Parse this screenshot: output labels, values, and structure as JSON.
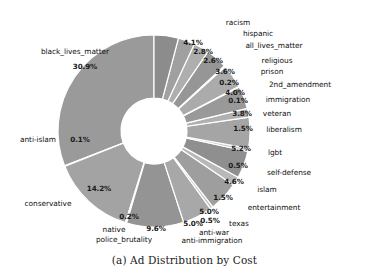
{
  "figure": {
    "caption": "(a) Ad Distribution by Cost",
    "background": "#ffffff"
  },
  "chart_data": {
    "type": "pie",
    "variant": "donut",
    "title": "(a) Ad Distribution by Cost",
    "xlabel": "",
    "ylabel": "",
    "legend": "none",
    "grid": false,
    "value_unit": "percent",
    "autopct_format": "%.1f%%",
    "start_angle_deg": 90,
    "direction": "counterclockwise",
    "center": {
      "x": 154,
      "y": 131
    },
    "outer_radius": 96,
    "inner_radius": 33,
    "categories": [
      "black_lives_matter",
      "anti-islam",
      "conservative",
      "native",
      "police_brutality",
      "anti-immigration",
      "anti-war",
      "texas",
      "entertainment",
      "islam",
      "self-defense",
      "lgbt",
      "liberalism",
      "veteran",
      "immigration",
      "2nd_amendment",
      "prison",
      "religious",
      "all_lives_matter",
      "hispanic",
      "racism"
    ],
    "values": [
      30.9,
      0.1,
      14.2,
      0.2,
      9.6,
      5.0,
      0.5,
      5.0,
      1.5,
      4.6,
      0.5,
      5.2,
      1.5,
      3.8,
      0.1,
      4.0,
      0.2,
      3.6,
      2.6,
      2.8,
      4.1
    ],
    "value_labels": [
      "30.9%",
      "0.1%",
      "14.2%",
      "0.2%",
      "9.6%",
      "5.0%",
      "0.5%",
      "5.0%",
      "1.5%",
      "4.6%",
      "0.5%",
      "5.2%",
      "1.5%",
      "3.8%",
      "0.1%",
      "4.0%",
      "0.2%",
      "3.6%",
      "2.6%",
      "2.8%",
      "4.1%"
    ],
    "slice_colors": [
      "#9a9a9a",
      "#b4b4b4",
      "#a3a3a3",
      "#bdbdbd",
      "#949494",
      "#a8a8a8",
      "#c2c2c2",
      "#9e9e9e",
      "#b8b8b8",
      "#8f8f8f",
      "#c6c6c6",
      "#a5a5a5",
      "#b0b0b0",
      "#999999",
      "#c0c0c0",
      "#ababab",
      "#bbbbbb",
      "#969696",
      "#aeaeae",
      "#a0a0a0",
      "#8c8c8c"
    ],
    "wedge_edge_color": "#ffffff",
    "wedge_edge_width": 1.2
  },
  "pct_labels": [
    {
      "text": "30.9%",
      "x": 85,
      "y": 66
    },
    {
      "text": "0.1%",
      "x": 80,
      "y": 139
    },
    {
      "text": "14.2%",
      "x": 99,
      "y": 188
    },
    {
      "text": "0.2%",
      "x": 129,
      "y": 216
    },
    {
      "text": "9.6%",
      "x": 156,
      "y": 228
    },
    {
      "text": "5.0%",
      "x": 193,
      "y": 223
    },
    {
      "text": "0.5%",
      "x": 210,
      "y": 220
    },
    {
      "text": "5.0%",
      "x": 209,
      "y": 211
    },
    {
      "text": "1.5%",
      "x": 223,
      "y": 197
    },
    {
      "text": "4.6%",
      "x": 234,
      "y": 181
    },
    {
      "text": "0.5%",
      "x": 238,
      "y": 165
    },
    {
      "text": "5.2%",
      "x": 241,
      "y": 148
    },
    {
      "text": "1.5%",
      "x": 243,
      "y": 128
    },
    {
      "text": "3.8%",
      "x": 242,
      "y": 113
    },
    {
      "text": "0.1%",
      "x": 238,
      "y": 100
    },
    {
      "text": "4.0%",
      "x": 235,
      "y": 92
    },
    {
      "text": "0.2%",
      "x": 229,
      "y": 82
    },
    {
      "text": "3.6%",
      "x": 225,
      "y": 71
    },
    {
      "text": "2.6%",
      "x": 213,
      "y": 60
    },
    {
      "text": "2.8%",
      "x": 203,
      "y": 51
    },
    {
      "text": "4.1%",
      "x": 193,
      "y": 42
    }
  ],
  "cat_labels": [
    {
      "text": "black_lives_matter",
      "x": 75,
      "y": 51
    },
    {
      "text": "anti-islam",
      "x": 38,
      "y": 139
    },
    {
      "text": "conservative",
      "x": 48,
      "y": 203
    },
    {
      "text": "native",
      "x": 114,
      "y": 229
    },
    {
      "text": "police_brutality",
      "x": 124,
      "y": 239
    },
    {
      "text": "anti-immigration",
      "x": 212,
      "y": 240
    },
    {
      "text": "anti-war",
      "x": 214,
      "y": 232
    },
    {
      "text": "texas",
      "x": 239,
      "y": 223
    },
    {
      "text": "entertainment",
      "x": 274,
      "y": 207
    },
    {
      "text": "islam",
      "x": 267,
      "y": 189
    },
    {
      "text": "self-defense",
      "x": 289,
      "y": 172
    },
    {
      "text": "lgbt",
      "x": 275,
      "y": 152
    },
    {
      "text": "liberalism",
      "x": 284,
      "y": 129
    },
    {
      "text": "veteran",
      "x": 277,
      "y": 113
    },
    {
      "text": "immigration",
      "x": 288,
      "y": 99
    },
    {
      "text": "2nd_amendment",
      "x": 300,
      "y": 84
    },
    {
      "text": "prison",
      "x": 272,
      "y": 71
    },
    {
      "text": "religious",
      "x": 277,
      "y": 60
    },
    {
      "text": "all_lives_matter",
      "x": 274,
      "y": 45
    },
    {
      "text": "hispanic",
      "x": 258,
      "y": 33
    },
    {
      "text": "racism",
      "x": 238,
      "y": 22
    }
  ]
}
